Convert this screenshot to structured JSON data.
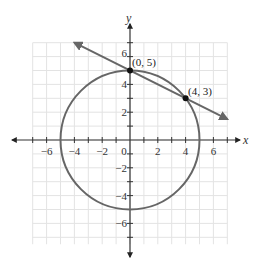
{
  "chart_data": {
    "type": "line",
    "title": "",
    "xlabel": "x",
    "ylabel": "y",
    "xlim": [
      -7,
      7
    ],
    "ylim": [
      -7,
      7
    ],
    "grid": true,
    "x_ticks": [
      -6,
      -4,
      -2,
      0,
      2,
      4,
      6
    ],
    "y_ticks": [
      -6,
      -4,
      -2,
      2,
      4,
      6
    ],
    "x_tick_labels": [
      "−6",
      "−4",
      "−2",
      "0",
      "2",
      "4",
      "6"
    ],
    "y_tick_labels": [
      "−6",
      "−4",
      "−2",
      "2",
      "4",
      "6"
    ],
    "series": [
      {
        "name": "circle",
        "kind": "circle",
        "center": [
          0,
          0
        ],
        "radius": 5,
        "equation": "x^2 + y^2 = 25"
      },
      {
        "name": "line",
        "kind": "line",
        "equation": "y = -x/2 + 5",
        "x_range": [
          -4,
          7
        ],
        "arrows": "both"
      }
    ],
    "points": [
      {
        "x": 0,
        "y": 5,
        "label": "(0, 5)"
      },
      {
        "x": 4,
        "y": 3,
        "label": "(4, 3)"
      }
    ],
    "colors": {
      "curve": "#666666",
      "axis": "#333333",
      "grid": "#e3e3e3",
      "point": "#111111"
    }
  },
  "labels": {
    "x_axis": "x",
    "y_axis": "y",
    "point_a": "(0, 5)",
    "point_b": "(4, 3)",
    "xt0": "−6",
    "xt1": "−4",
    "xt2": "−2",
    "xt3": "0",
    "xt4": "2",
    "xt5": "4",
    "xt6": "6",
    "yt0": "6",
    "yt1": "4",
    "yt2": "2",
    "yt3": "−2",
    "yt4": "−4",
    "yt5": "−6"
  }
}
